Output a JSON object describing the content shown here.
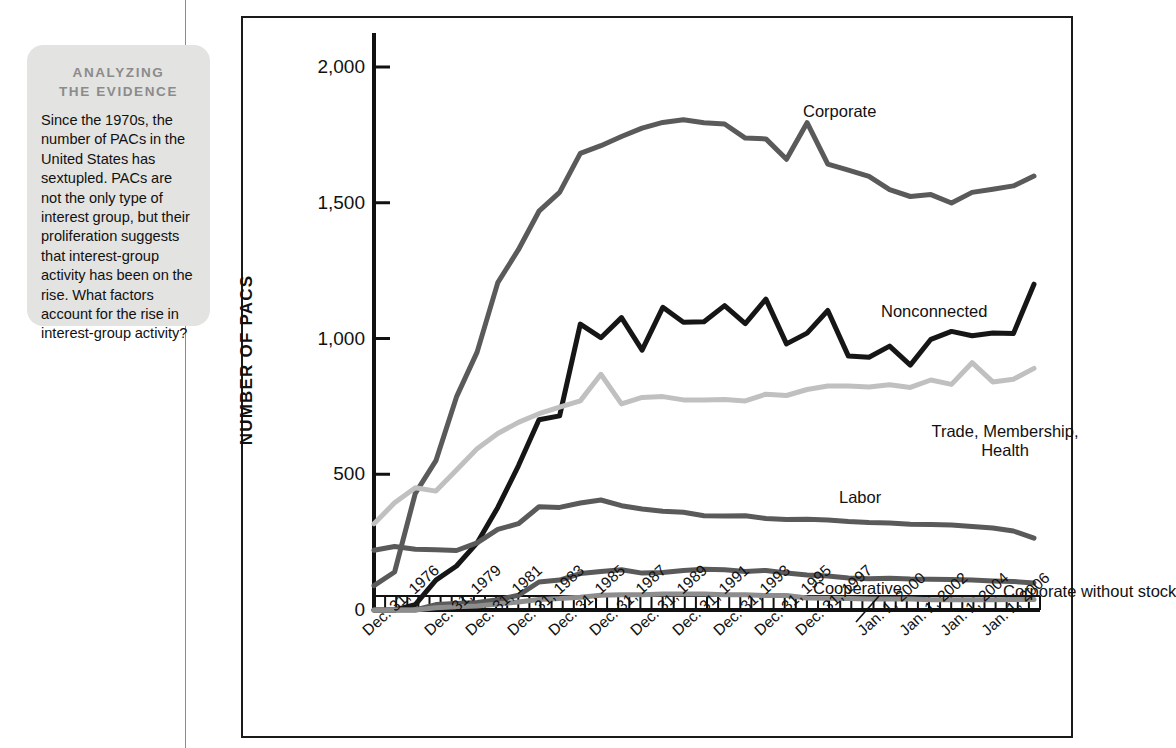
{
  "callout": {
    "title_line1": "ANALYZING",
    "title_line2": "THE EVIDENCE",
    "body": "Since the 1970s, the number of PACs in the United States has sextupled. PACs are not the only type of interest group, but their proliferation suggests that interest-group activity has been on the rise. What factors account for the rise in interest-group activity?"
  },
  "chart_data": {
    "type": "line",
    "title": "",
    "xlabel": "",
    "ylabel": "NUMBER OF PACS",
    "ylim": [
      0,
      2000
    ],
    "yticks": [
      0,
      500,
      1000,
      1500,
      2000
    ],
    "ytick_labels": [
      "0",
      "500",
      "1,000",
      "1,500",
      "2,000"
    ],
    "grid": false,
    "legend": "inline-labels",
    "tick_labels": [
      "Dec. 31, 1976",
      "Dec. 31, 1979",
      "Dec. 31, 1981",
      "Dec. 31, 1983",
      "Dec. 31, 1985",
      "Dec. 31, 1987",
      "Dec. 31, 1989",
      "Dec. 31, 1991",
      "Dec. 31, 1993",
      "Dec. 31, 1995",
      "Dec. 31, 1997",
      "Jan. 1, 2000",
      "Jan. 1, 2002",
      "Jan. 1, 2004",
      "Jan. 1, 2006"
    ],
    "tick_years": [
      1976,
      1979,
      1981,
      1983,
      1985,
      1987,
      1989,
      1991,
      1993,
      1995,
      1997,
      2000,
      2002,
      2004,
      2006
    ],
    "x": [
      1974,
      1975,
      1976,
      1977,
      1978,
      1979,
      1980,
      1981,
      1982,
      1983,
      1984,
      1985,
      1986,
      1987,
      1988,
      1989,
      1990,
      1991,
      1992,
      1993,
      1994,
      1995,
      1996,
      1997,
      1998,
      1999,
      2000,
      2001,
      2002,
      2003,
      2004,
      2005,
      2006
    ],
    "series": [
      {
        "name": "Corporate",
        "color": "#5a5a5a",
        "width": 5,
        "values": [
          90,
          140,
          430,
          550,
          785,
          950,
          1206,
          1327,
          1469,
          1538,
          1682,
          1710,
          1744,
          1775,
          1796,
          1806,
          1795,
          1790,
          1738,
          1735,
          1660,
          1795,
          1642,
          1620,
          1597,
          1548,
          1523,
          1530,
          1499,
          1538,
          1550,
          1562,
          1598
        ],
        "label_x": 560,
        "label_y": 84
      },
      {
        "name": "Nonconnected",
        "color": "#161616",
        "width": 5,
        "values": [
          0,
          0,
          20,
          110,
          162,
          247,
          378,
          531,
          701,
          715,
          1053,
          1003,
          1077,
          957,
          1115,
          1060,
          1062,
          1121,
          1055,
          1145,
          980,
          1020,
          1103,
          935,
          931,
          972,
          902,
          997,
          1026,
          1010,
          1020,
          1018,
          1200
        ],
        "label_x": 638,
        "label_y": 284
      },
      {
        "name": "Trade, Membership,\nHealth",
        "label_html": [
          "Trade, Membership,",
          "Health"
        ],
        "color": "#c0c0c0",
        "width": 5,
        "values": [
          318,
          395,
          450,
          438,
          516,
          594,
          650,
          691,
          723,
          747,
          770,
          868,
          759,
          783,
          786,
          774,
          774,
          775,
          770,
          795,
          790,
          812,
          825,
          825,
          821,
          830,
          820,
          847,
          831,
          911,
          840,
          850,
          890
        ],
        "label_x": 762,
        "label_y": 404
      },
      {
        "name": "Labor",
        "color": "#5a5a5a",
        "width": 5,
        "values": [
          220,
          234,
          224,
          222,
          219,
          247,
          297,
          318,
          380,
          378,
          394,
          405,
          384,
          372,
          364,
          360,
          347,
          346,
          347,
          337,
          333,
          334,
          332,
          326,
          322,
          320,
          316,
          315,
          313,
          307,
          302,
          291,
          265
        ],
        "label_x": 596,
        "label_y": 470
      },
      {
        "name": "Corporate without stock",
        "color": "#5a5a5a",
        "width": 5,
        "values": [
          0,
          0,
          0,
          20,
          24,
          28,
          38,
          54,
          103,
          110,
          134,
          142,
          148,
          136,
          138,
          146,
          150,
          148,
          142,
          146,
          136,
          129,
          125,
          118,
          115,
          117,
          114,
          113,
          112,
          110,
          107,
          105,
          100
        ],
        "label_x": 760,
        "label_y": 564
      },
      {
        "name": "Cooperative",
        "color": "#8d8d8d",
        "width": 5,
        "values": [
          0,
          0,
          0,
          8,
          12,
          15,
          22,
          30,
          39,
          42,
          47,
          54,
          56,
          56,
          59,
          59,
          59,
          56,
          56,
          53,
          53,
          44,
          43,
          42,
          41,
          41,
          40,
          38,
          38,
          38,
          38,
          39,
          39
        ],
        "label_x": 570,
        "label_y": 561,
        "leader": {
          "x1": 636,
          "y1": 578,
          "x2": 613,
          "y2": 604
        }
      }
    ]
  }
}
